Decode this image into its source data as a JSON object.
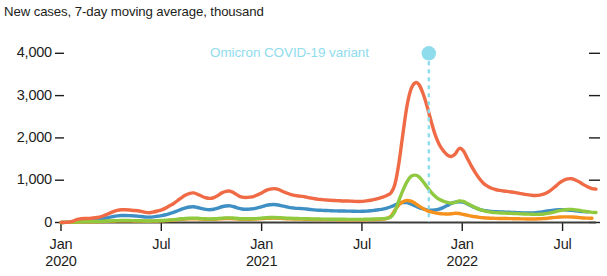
{
  "chart_data": {
    "type": "line",
    "title": "New cases, 7-day moving average, thousand",
    "xlabel": "",
    "ylabel": "",
    "ylim": [
      0,
      4000
    ],
    "yticks": [
      0,
      1000,
      2000,
      3000,
      4000
    ],
    "ytick_labels": [
      "0",
      "1,000",
      "2,000",
      "3,000",
      "4,000"
    ],
    "grid": false,
    "legend": "none",
    "x_start": "2020-01",
    "x_end": "2022-09",
    "xticks": [
      "Jan 2020",
      "Jul",
      "Jan 2021",
      "Jul",
      "Jan 2022",
      "Jul"
    ],
    "xtick_labels": [
      {
        "month": "Jan",
        "year": "2020"
      },
      {
        "month": "Jul",
        "year": ""
      },
      {
        "month": "Jan",
        "year": "2021"
      },
      {
        "month": "Jul",
        "year": ""
      },
      {
        "month": "Jan",
        "year": "2022"
      },
      {
        "month": "Jul",
        "year": ""
      }
    ],
    "annotations": [
      {
        "label": "Omicron COVID-19 variant",
        "x": "2021-11",
        "y": 4000,
        "color": "#8fdced",
        "marker": "dot",
        "line": "dashed-vertical"
      }
    ],
    "series": [
      {
        "name": "World",
        "color": "#ef6a45",
        "values": [
          2,
          4,
          10,
          30,
          72,
          90,
          95,
          98,
          105,
          118,
          140,
          175,
          215,
          255,
          285,
          300,
          300,
          295,
          285,
          278,
          262,
          240,
          232,
          248,
          272,
          300,
          340,
          395,
          450,
          520,
          590,
          648,
          690,
          700,
          665,
          620,
          585,
          570,
          590,
          640,
          700,
          735,
          742,
          700,
          640,
          600,
          590,
          600,
          620,
          660,
          705,
          760,
          790,
          800,
          782,
          740,
          700,
          665,
          642,
          628,
          618,
          600,
          580,
          562,
          548,
          540,
          532,
          525,
          520,
          515,
          510,
          508,
          505,
          500,
          498,
          500,
          510,
          525,
          545,
          570,
          600,
          640,
          700,
          900,
          1400,
          2100,
          2750,
          3150,
          3300,
          3260,
          3050,
          2750,
          2400,
          2080,
          1850,
          1700,
          1600,
          1560,
          1620,
          1750,
          1700,
          1520,
          1340,
          1180,
          1040,
          930,
          860,
          810,
          780,
          760,
          745,
          735,
          720,
          705,
          690,
          672,
          658,
          645,
          640,
          648,
          672,
          715,
          780,
          860,
          940,
          1000,
          1030,
          1035,
          1000,
          950,
          890,
          840,
          800,
          790
        ]
      },
      {
        "name": "Region A",
        "color": "#8fc93f",
        "values": [
          1,
          2,
          4,
          8,
          14,
          18,
          20,
          21,
          22,
          24,
          27,
          31,
          36,
          41,
          45,
          47,
          47,
          46,
          44,
          42,
          40,
          37,
          36,
          38,
          42,
          46,
          52,
          60,
          68,
          78,
          88,
          96,
          102,
          104,
          99,
          92,
          87,
          84,
          87,
          95,
          104,
          109,
          110,
          104,
          95,
          89,
          87,
          89,
          92,
          98,
          105,
          113,
          117,
          119,
          116,
          110,
          104,
          99,
          95,
          93,
          92,
          89,
          86,
          83,
          81,
          80,
          79,
          78,
          77,
          76,
          76,
          75,
          75,
          74,
          74,
          75,
          76,
          78,
          81,
          85,
          90,
          100,
          130,
          260,
          520,
          760,
          960,
          1090,
          1120,
          1080,
          970,
          840,
          720,
          620,
          550,
          505,
          475,
          460,
          475,
          510,
          498,
          450,
          400,
          352,
          312,
          280,
          258,
          243,
          234,
          228,
          223,
          220,
          216,
          211,
          207,
          202,
          198,
          194,
          192,
          194,
          202,
          215,
          234,
          258,
          282,
          300,
          309,
          310,
          300,
          285,
          267,
          252,
          240,
          237
        ]
      },
      {
        "name": "Region B",
        "color": "#f6911e",
        "values": [
          1,
          2,
          3,
          6,
          11,
          14,
          15,
          16,
          17,
          18,
          21,
          25,
          30,
          34,
          38,
          40,
          40,
          39,
          37,
          36,
          34,
          31,
          30,
          32,
          35,
          39,
          44,
          51,
          58,
          67,
          76,
          83,
          88,
          90,
          85,
          79,
          75,
          73,
          75,
          82,
          90,
          94,
          95,
          90,
          82,
          77,
          75,
          77,
          80,
          85,
          91,
          98,
          101,
          103,
          100,
          95,
          90,
          85,
          82,
          80,
          79,
          77,
          74,
          72,
          70,
          69,
          68,
          67,
          67,
          66,
          66,
          65,
          65,
          64,
          64,
          65,
          66,
          68,
          70,
          74,
          80,
          95,
          150,
          290,
          420,
          490,
          520,
          505,
          455,
          390,
          330,
          282,
          250,
          228,
          214,
          205,
          200,
          206,
          218,
          212,
          192,
          172,
          152,
          135,
          121,
          112,
          105,
          101,
          98,
          96,
          95,
          93,
          91,
          89,
          87,
          85,
          84,
          83,
          84,
          87,
          93,
          101,
          111,
          121,
          129,
          133,
          133,
          129,
          123,
          115,
          108,
          103,
          102
        ]
      },
      {
        "name": "Region C",
        "color": "#3d8fc4",
        "values": [
          1,
          3,
          7,
          18,
          42,
          55,
          58,
          60,
          63,
          70,
          82,
          100,
          122,
          142,
          158,
          166,
          166,
          163,
          156,
          151,
          142,
          130,
          126,
          134,
          147,
          161,
          183,
          212,
          240,
          277,
          314,
          345,
          366,
          373,
          354,
          330,
          311,
          303,
          313,
          340,
          372,
          390,
          394,
          372,
          340,
          318,
          312,
          318,
          329,
          350,
          374,
          404,
          420,
          425,
          415,
          393,
          372,
          353,
          341,
          333,
          328,
          318,
          308,
          298,
          291,
          287,
          282,
          279,
          276,
          273,
          271,
          270,
          268,
          265,
          264,
          265,
          270,
          278,
          289,
          302,
          318,
          340,
          372,
          412,
          450,
          472,
          470,
          440,
          396,
          352,
          320,
          300,
          292,
          296,
          316,
          352,
          400,
          448,
          480,
          492,
          480,
          440,
          392,
          348,
          312,
          288,
          272,
          262,
          256,
          252,
          248,
          244,
          240,
          236,
          231,
          228,
          226,
          228,
          234,
          244,
          258,
          272,
          286,
          296,
          302,
          303,
          296,
          286,
          274,
          264,
          256,
          253
        ]
      }
    ]
  }
}
